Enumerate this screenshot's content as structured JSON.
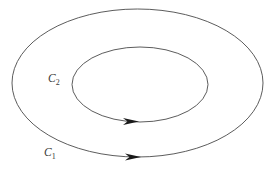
{
  "figure": {
    "background_color": "#ffffff",
    "width": 277,
    "height": 171
  },
  "chart_data": {
    "type": "diagram",
    "title": "",
    "subtitle": "",
    "xlabel": "",
    "ylabel": "",
    "grid": false,
    "legend": null,
    "axis_visible": false,
    "xlim": [
      0,
      277
    ],
    "ylim": [
      0,
      171
    ],
    "shapes": [
      {
        "name": "outer-contour",
        "kind": "ellipse",
        "label": "C1",
        "label_text": "C",
        "label_subscript": "1",
        "cx": 137.5,
        "cy": 83.0,
        "rx": 125.5,
        "ry": 74.0,
        "stroke": "#4a4a4a",
        "stroke_width": 0.9,
        "fill": "none",
        "orientation": "counterclockwise",
        "label_x": 44,
        "label_y": 156
      },
      {
        "name": "inner-contour",
        "kind": "ellipse",
        "label": "C2",
        "label_text": "C",
        "label_subscript": "2",
        "cx": 140.0,
        "cy": 84.5,
        "rx": 68.0,
        "ry": 37.5,
        "stroke": "#4a4a4a",
        "stroke_width": 0.9,
        "fill": "none",
        "orientation": "counterclockwise",
        "label_x": 48,
        "label_y": 82
      }
    ],
    "arrows": [
      {
        "name": "inner-direction-arrow",
        "on_curve": "C2",
        "tip_x": 139,
        "tip_y": 121.5,
        "direction": "right",
        "fill": "#1a1a1a",
        "length": 16,
        "half_width": 3.4
      },
      {
        "name": "outer-direction-arrow",
        "on_curve": "C1",
        "tip_x": 141,
        "tip_y": 157.0,
        "direction": "right",
        "fill": "#1a1a1a",
        "length": 16,
        "half_width": 3.6
      }
    ],
    "annotations": [
      {
        "name": "label-c2",
        "text": "C",
        "subscript": "2",
        "x": 48,
        "y": 82
      },
      {
        "name": "label-c1",
        "text": "C",
        "subscript": "1",
        "x": 44,
        "y": 156
      }
    ]
  },
  "labels": {
    "outer": {
      "base": "C",
      "sub": "1"
    },
    "inner": {
      "base": "C",
      "sub": "2"
    }
  },
  "colors": {
    "stroke": "#4a4a4a",
    "arrow": "#1a1a1a",
    "label": "#3a3a3a",
    "background": "#ffffff"
  }
}
